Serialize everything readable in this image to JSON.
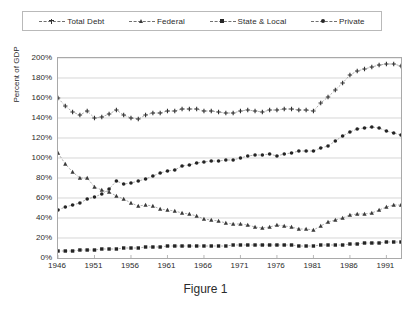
{
  "legend": {
    "entries": [
      {
        "label": "Total Debt",
        "marker": "cross-marker"
      },
      {
        "label": "Federal",
        "marker": "triangle-marker"
      },
      {
        "label": "State & Local",
        "marker": "square-marker"
      },
      {
        "label": "Private",
        "marker": "circle-marker"
      }
    ]
  },
  "caption": "Figure 1",
  "chart_data": {
    "type": "line",
    "title": "",
    "subtitle": "",
    "xlabel": "",
    "ylabel": "Percent of GDP",
    "xlim": [
      1946,
      1993
    ],
    "ylim": [
      0,
      200
    ],
    "ytick_labels": [
      "200%",
      "180%",
      "160%",
      "140%",
      "120%",
      "100%",
      "80%",
      "60%",
      "40%",
      "20%",
      "0%"
    ],
    "ytick_values": [
      200,
      180,
      160,
      140,
      120,
      100,
      80,
      60,
      40,
      20,
      0
    ],
    "xtick_labels": [
      "1946",
      "1951",
      "1956",
      "1961",
      "1966",
      "1971",
      "1976",
      "1981",
      "1986",
      "1991"
    ],
    "xtick_values": [
      1946,
      1951,
      1956,
      1961,
      1966,
      1971,
      1976,
      1981,
      1986,
      1991
    ],
    "grid": "horizontal",
    "legend_position": "top",
    "x": [
      1946,
      1947,
      1948,
      1949,
      1950,
      1951,
      1952,
      1953,
      1954,
      1955,
      1956,
      1957,
      1958,
      1959,
      1960,
      1961,
      1962,
      1963,
      1964,
      1965,
      1966,
      1967,
      1968,
      1969,
      1970,
      1971,
      1972,
      1973,
      1974,
      1975,
      1976,
      1977,
      1978,
      1979,
      1980,
      1981,
      1982,
      1983,
      1984,
      1985,
      1986,
      1987,
      1988,
      1989,
      1990,
      1991,
      1992,
      1993
    ],
    "series": [
      {
        "name": "Total Debt",
        "marker": "cross-marker",
        "values": [
          160,
          152,
          146,
          143,
          147,
          140,
          141,
          144,
          148,
          143,
          140,
          139,
          143,
          145,
          145,
          147,
          147,
          149,
          149,
          149,
          147,
          147,
          146,
          145,
          145,
          147,
          148,
          147,
          146,
          148,
          148,
          149,
          149,
          148,
          148,
          147,
          155,
          161,
          168,
          175,
          183,
          187,
          189,
          191,
          193,
          194,
          194,
          192
        ]
      },
      {
        "name": "Federal",
        "marker": "triangle-marker",
        "values": [
          105,
          94,
          86,
          80,
          80,
          71,
          68,
          66,
          62,
          59,
          55,
          52,
          53,
          52,
          49,
          48,
          47,
          45,
          44,
          42,
          39,
          38,
          37,
          35,
          34,
          34,
          33,
          31,
          30,
          31,
          33,
          32,
          31,
          29,
          29,
          28,
          32,
          36,
          38,
          40,
          43,
          44,
          44,
          45,
          48,
          51,
          53,
          53
        ]
      },
      {
        "name": "State & Local",
        "marker": "square-marker",
        "values": [
          7,
          7,
          7,
          8,
          8,
          8,
          9,
          9,
          9,
          10,
          10,
          10,
          11,
          11,
          11,
          12,
          12,
          12,
          12,
          12,
          12,
          12,
          12,
          12,
          13,
          13,
          13,
          13,
          13,
          13,
          13,
          13,
          13,
          12,
          12,
          12,
          13,
          13,
          13,
          13,
          14,
          14,
          15,
          15,
          15,
          16,
          16,
          16
        ]
      },
      {
        "name": "Private",
        "marker": "circle-marker",
        "values": [
          48,
          51,
          53,
          55,
          59,
          61,
          64,
          69,
          77,
          74,
          75,
          77,
          79,
          82,
          85,
          87,
          88,
          92,
          93,
          95,
          96,
          97,
          97,
          98,
          98,
          100,
          102,
          103,
          103,
          104,
          102,
          104,
          105,
          107,
          107,
          107,
          110,
          112,
          117,
          122,
          126,
          129,
          130,
          131,
          130,
          127,
          125,
          123
        ]
      }
    ]
  }
}
